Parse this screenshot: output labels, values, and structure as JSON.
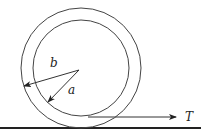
{
  "diagram": {
    "type": "physics-figure",
    "labels": {
      "outer_radius": "b",
      "inner_radius": "a",
      "force": "T"
    },
    "colors": {
      "stroke": "#333333",
      "ground": "#222222"
    }
  }
}
